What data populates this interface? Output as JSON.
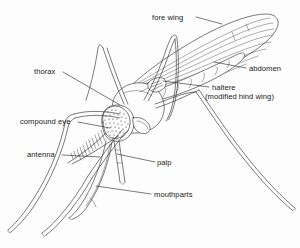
{
  "figure": {
    "style": "black-and-white line drawing with leader-line labels",
    "background_color": "#fdfdfd",
    "ink_color": "#2a2a2a",
    "text_color": "#1b1b1b"
  },
  "labels": [
    {
      "id": "fore-wing",
      "text": "fore wing",
      "text_x": 152,
      "text_y": 20,
      "anchor": "start",
      "leader": "M 196 17 L 222 24",
      "points_to": "upper surface of the fore wing"
    },
    {
      "id": "abdomen",
      "text": "abdomen",
      "text_x": 249,
      "text_y": 71,
      "anchor": "start",
      "leader": "M 246 68 L 214 62",
      "points_to": "segmented abdomen beneath the wing"
    },
    {
      "id": "haltere",
      "text": "haltere",
      "text_x": 212,
      "text_y": 90,
      "anchor": "start",
      "leader": "M 209 87 L 163 81",
      "points_to": "haltere at the base of the wing"
    },
    {
      "id": "haltere-sub",
      "text": "(modified hind wing)",
      "text_x": 205,
      "text_y": 99,
      "anchor": "start",
      "leader": "",
      "points_to": "continuation of haltere label"
    },
    {
      "id": "thorax",
      "text": "thorax",
      "text_x": 34,
      "text_y": 74,
      "anchor": "start",
      "leader": "M 63 72 L 120 105",
      "points_to": "rounded thorax"
    },
    {
      "id": "compound-eye",
      "text": "compound eye",
      "text_x": 20,
      "text_y": 124,
      "anchor": "start",
      "leader": "M 78 122 L 110 128",
      "points_to": "stippled compound eye on the head"
    },
    {
      "id": "antenna",
      "text": "antenna",
      "text_x": 27,
      "text_y": 157,
      "anchor": "start",
      "leader": "M 62 155 L 100 157",
      "points_to": "plumose antenna"
    },
    {
      "id": "palp",
      "text": "palp",
      "text_x": 157,
      "text_y": 165,
      "anchor": "start",
      "leader": "M 155 162 L 117 154",
      "points_to": "maxillary palp beside the proboscis"
    },
    {
      "id": "mouthparts",
      "text": "mouthparts",
      "text_x": 154,
      "text_y": 197,
      "anchor": "start",
      "leader": "M 151 194 L 96 186",
      "points_to": "elongated piercing mouthparts (proboscis)"
    }
  ],
  "anatomy_parts": [
    "fore wing",
    "abdomen",
    "haltere",
    "thorax",
    "compound eye",
    "antenna",
    "palp",
    "mouthparts",
    "legs"
  ]
}
